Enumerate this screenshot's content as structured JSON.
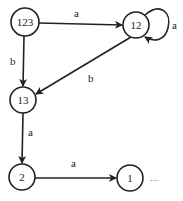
{
  "diagram": {
    "type": "state-transition-graph",
    "colors": {
      "stroke": "#222222",
      "background": "#ffffff"
    },
    "nodes": [
      {
        "id": "n123",
        "label": "123",
        "cx": 25,
        "cy": 22,
        "r": 14
      },
      {
        "id": "n12",
        "label": "12",
        "cx": 136,
        "cy": 25,
        "r": 13
      },
      {
        "id": "n13",
        "label": "13",
        "cx": 23,
        "cy": 100,
        "r": 13
      },
      {
        "id": "n2",
        "label": "2",
        "cx": 22,
        "cy": 177,
        "r": 13
      },
      {
        "id": "n1",
        "label": "1",
        "cx": 130,
        "cy": 178,
        "r": 13
      }
    ],
    "edges": [
      {
        "from": "123",
        "to": "12",
        "label": "a"
      },
      {
        "from": "12",
        "to": "12",
        "label": "a"
      },
      {
        "from": "123",
        "to": "13",
        "label": "b"
      },
      {
        "from": "12",
        "to": "13",
        "label": "b"
      },
      {
        "from": "13",
        "to": "2",
        "label": "a"
      },
      {
        "from": "2",
        "to": "1",
        "label": "a"
      }
    ],
    "ellipsis": "..."
  }
}
